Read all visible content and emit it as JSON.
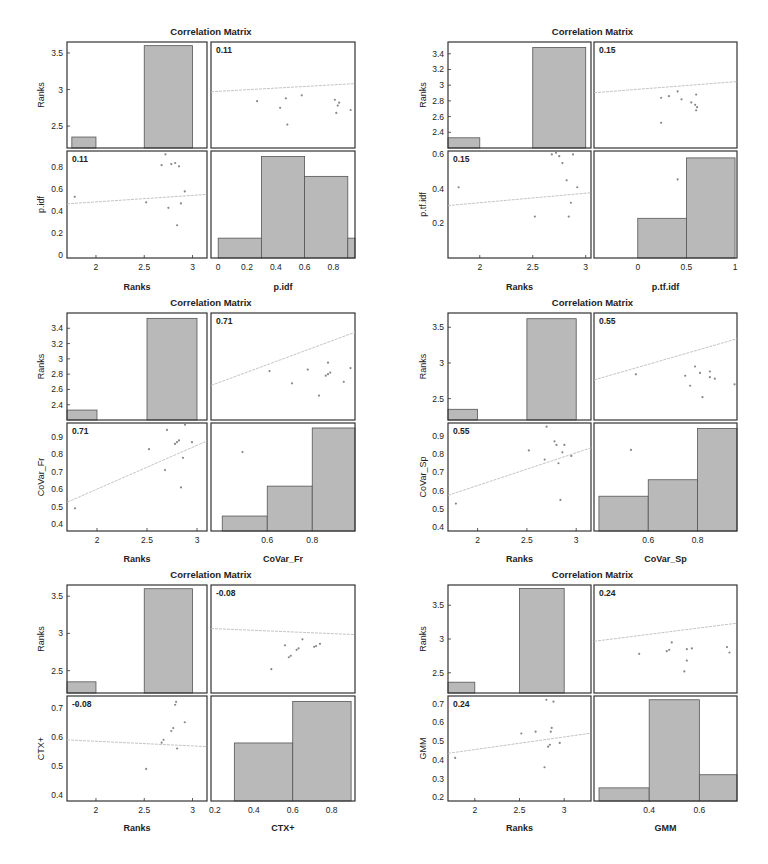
{
  "figure": {
    "panel_title": "Correlation Matrix",
    "bar_fill": "#b9b9b9",
    "axis_color": "#333333",
    "fit_line_color": "#bdbdbd",
    "point_color": "#888888"
  },
  "chart_data": [
    {
      "type": "scatter-matrix",
      "title": "Correlation Matrix",
      "variables": [
        "Ranks",
        "p.idf"
      ],
      "correlation": 0.11,
      "correlation_label": "0.11",
      "ranks_hist": {
        "bins": [
          [
            1.75,
            2.0,
            2.35
          ],
          [
            2.5,
            3.0,
            3.6
          ]
        ],
        "ylim": [
          2.2,
          3.65
        ],
        "yticks": [
          2.5,
          3,
          3.5
        ]
      },
      "var_hist": {
        "bins": [
          [
            0.0,
            0.3,
            0.16
          ],
          [
            0.3,
            0.6,
            0.9
          ],
          [
            0.6,
            0.9,
            0.72
          ],
          [
            0.9,
            0.95,
            0.16
          ]
        ],
        "ylim": [
          -0.02,
          0.95
        ],
        "xticks": [
          0,
          0.2,
          0.4,
          0.6,
          0.8
        ],
        "xlim": [
          -0.05,
          0.95
        ]
      },
      "points": {
        "ranks": [
          1.78,
          2.52,
          2.68,
          2.78,
          2.82,
          2.84,
          2.86,
          2.75,
          2.72,
          2.92,
          2.88
        ],
        "values": [
          0.53,
          0.48,
          0.82,
          0.83,
          0.84,
          0.27,
          0.81,
          0.43,
          0.92,
          0.58,
          0.47
        ]
      },
      "ranks_xlim": [
        1.7,
        3.15
      ],
      "ranks_xticks": [
        2,
        2.5,
        3
      ],
      "var_ylim": [
        -0.03,
        0.95
      ],
      "var_yticks": [
        0,
        0.2,
        0.4,
        0.6,
        0.8
      ],
      "xlabels": [
        "Ranks",
        "p.idf"
      ],
      "ylabels": [
        "Ranks",
        "p.idf"
      ]
    },
    {
      "type": "scatter-matrix",
      "title": "Correlation Matrix",
      "variables": [
        "Ranks",
        "p.tf.idf"
      ],
      "correlation": 0.15,
      "correlation_label": "0.15",
      "ranks_hist": {
        "bins": [
          [
            1.7,
            2.0,
            2.33
          ],
          [
            2.5,
            3.0,
            3.48
          ]
        ],
        "ylim": [
          2.2,
          3.55
        ],
        "yticks": [
          2.4,
          2.6,
          2.8,
          3,
          3.2,
          3.4
        ]
      },
      "var_hist": {
        "bins": [
          [
            0.0,
            0.5,
            0.23
          ],
          [
            0.5,
            1.0,
            0.58
          ]
        ],
        "ylim": [
          0.0,
          0.62
        ],
        "xticks": [
          0,
          0.5,
          1
        ],
        "xlim": [
          -0.45,
          1.02
        ]
      },
      "points": {
        "ranks": [
          1.8,
          2.52,
          2.68,
          2.78,
          2.82,
          2.84,
          2.86,
          2.75,
          2.72,
          2.92,
          2.88
        ],
        "values": [
          0.41,
          0.24,
          0.6,
          0.55,
          0.45,
          0.24,
          0.32,
          0.59,
          0.61,
          0.41,
          0.6
        ]
      },
      "ranks_xlim": [
        1.7,
        3.05
      ],
      "ranks_xticks": [
        2,
        2.5,
        3
      ],
      "var_ylim": [
        0.0,
        0.62
      ],
      "var_yticks": [
        0.2,
        0.4,
        0.6
      ],
      "xlabels": [
        "Ranks",
        "p.tf.idf"
      ],
      "ylabels": [
        "Ranks",
        "p.tf.idf"
      ]
    },
    {
      "type": "scatter-matrix",
      "title": "Correlation Matrix",
      "variables": [
        "Ranks",
        "CoVar_Fr"
      ],
      "correlation": 0.71,
      "correlation_label": "0.71",
      "ranks_hist": {
        "bins": [
          [
            1.7,
            2.0,
            2.33
          ],
          [
            2.5,
            3.0,
            3.53
          ]
        ],
        "ylim": [
          2.2,
          3.6
        ],
        "yticks": [
          2.4,
          2.6,
          2.8,
          3,
          3.2,
          3.4
        ]
      },
      "var_hist": {
        "bins": [
          [
            0.4,
            0.6,
            0.44
          ],
          [
            0.6,
            0.8,
            0.62
          ],
          [
            0.8,
            0.99,
            0.97
          ]
        ],
        "ylim": [
          0.35,
          1.0
        ],
        "xticks": [
          0.6,
          0.8
        ],
        "xlim": [
          0.35,
          0.99
        ]
      },
      "points": {
        "ranks": [
          1.78,
          2.52,
          2.68,
          2.78,
          2.82,
          2.84,
          2.86,
          2.7,
          2.8,
          2.95,
          2.88
        ],
        "values": [
          0.49,
          0.83,
          0.71,
          0.86,
          0.88,
          0.61,
          0.78,
          0.94,
          0.87,
          0.87,
          0.97
        ]
      },
      "ranks_xlim": [
        1.7,
        3.1
      ],
      "ranks_xticks": [
        2,
        2.5,
        3
      ],
      "var_ylim": [
        0.36,
        0.98
      ],
      "var_yticks": [
        0.4,
        0.5,
        0.6,
        0.7,
        0.8,
        0.9
      ],
      "xlabels": [
        "Ranks",
        "CoVar_Fr"
      ],
      "ylabels": [
        "Ranks",
        "CoVar_Fr"
      ]
    },
    {
      "type": "scatter-matrix",
      "title": "Correlation Matrix",
      "variables": [
        "Ranks",
        "CoVar_Sp"
      ],
      "correlation": 0.55,
      "correlation_label": "0.55",
      "ranks_hist": {
        "bins": [
          [
            1.7,
            2.0,
            2.35
          ],
          [
            2.5,
            3.0,
            3.62
          ]
        ],
        "ylim": [
          2.2,
          3.7
        ],
        "yticks": [
          2.5,
          3,
          3.5
        ]
      },
      "var_hist": {
        "bins": [
          [
            0.4,
            0.6,
            0.57
          ],
          [
            0.6,
            0.8,
            0.66
          ],
          [
            0.8,
            0.96,
            0.94
          ]
        ],
        "ylim": [
          0.38,
          0.97
        ],
        "xticks": [
          0.6,
          0.8
        ],
        "xlim": [
          0.38,
          0.96
        ]
      },
      "points": {
        "ranks": [
          1.78,
          2.52,
          2.68,
          2.78,
          2.82,
          2.84,
          2.86,
          2.7,
          2.8,
          2.95,
          2.88
        ],
        "values": [
          0.53,
          0.82,
          0.77,
          0.87,
          0.75,
          0.55,
          0.81,
          0.95,
          0.85,
          0.79,
          0.85
        ]
      },
      "ranks_xlim": [
        1.7,
        3.15
      ],
      "ranks_xticks": [
        2,
        2.5,
        3
      ],
      "var_ylim": [
        0.38,
        0.97
      ],
      "var_yticks": [
        0.4,
        0.5,
        0.6,
        0.7,
        0.8,
        0.9
      ],
      "xlabels": [
        "Ranks",
        "CoVar_Sp"
      ],
      "ylabels": [
        "Ranks",
        "CoVar_Sp"
      ]
    },
    {
      "type": "scatter-matrix",
      "title": "Correlation Matrix",
      "variables": [
        "Ranks",
        "CTX+"
      ],
      "correlation": -0.08,
      "correlation_label": "-0.08",
      "ranks_hist": {
        "bins": [
          [
            1.7,
            2.0,
            2.35
          ],
          [
            2.5,
            3.0,
            3.6
          ]
        ],
        "ylim": [
          2.2,
          3.65
        ],
        "yticks": [
          2.5,
          3,
          3.5
        ]
      },
      "var_hist": {
        "bins": [
          [
            0.3,
            0.6,
            0.59
          ],
          [
            0.6,
            0.9,
            0.74
          ]
        ],
        "ylim": [
          0.38,
          0.76
        ],
        "xticks": [
          0.2,
          0.4,
          0.6,
          0.8
        ],
        "xlim": [
          0.18,
          0.92
        ]
      },
      "points": {
        "ranks": [
          1.8,
          2.52,
          2.68,
          2.7,
          2.78,
          2.8,
          2.82,
          2.84,
          2.86,
          2.92,
          2.83
        ],
        "values": [
          0.71,
          0.49,
          0.58,
          0.59,
          0.62,
          0.63,
          0.71,
          0.56,
          0.74,
          0.65,
          0.72
        ]
      },
      "ranks_xlim": [
        1.7,
        3.15
      ],
      "ranks_xticks": [
        2,
        2.5,
        3
      ],
      "var_ylim": [
        0.38,
        0.74
      ],
      "var_yticks": [
        0.4,
        0.5,
        0.6,
        0.7
      ],
      "xlabels": [
        "Ranks",
        "CTX+"
      ],
      "ylabels": [
        "Ranks",
        "CTX+"
      ]
    },
    {
      "type": "scatter-matrix",
      "title": "Correlation Matrix",
      "variables": [
        "Ranks",
        "GMM"
      ],
      "correlation": 0.24,
      "correlation_label": "0.24",
      "ranks_hist": {
        "bins": [
          [
            1.7,
            2.0,
            2.36
          ],
          [
            2.5,
            3.0,
            3.75
          ]
        ],
        "ylim": [
          2.2,
          3.8
        ],
        "yticks": [
          2.5,
          3,
          3.5
        ]
      },
      "var_hist": {
        "bins": [
          [
            0.2,
            0.4,
            0.25
          ],
          [
            0.4,
            0.6,
            0.72
          ],
          [
            0.6,
            0.75,
            0.32
          ]
        ],
        "ylim": [
          0.18,
          0.74
        ],
        "xticks": [
          0.4,
          0.6
        ],
        "xlim": [
          0.18,
          0.75
        ]
      },
      "points": {
        "ranks": [
          1.78,
          2.52,
          2.68,
          2.78,
          2.82,
          2.84,
          2.86,
          2.8,
          2.88,
          2.95,
          2.85
        ],
        "values": [
          0.41,
          0.54,
          0.55,
          0.36,
          0.47,
          0.48,
          0.57,
          0.72,
          0.71,
          0.49,
          0.55
        ]
      },
      "ranks_xlim": [
        1.7,
        3.3
      ],
      "ranks_xticks": [
        2,
        2.5,
        3
      ],
      "var_ylim": [
        0.18,
        0.74
      ],
      "var_yticks": [
        0.2,
        0.3,
        0.4,
        0.5,
        0.6,
        0.7
      ],
      "xlabels": [
        "Ranks",
        "GMM"
      ],
      "ylabels": [
        "Ranks",
        "GMM"
      ]
    }
  ]
}
